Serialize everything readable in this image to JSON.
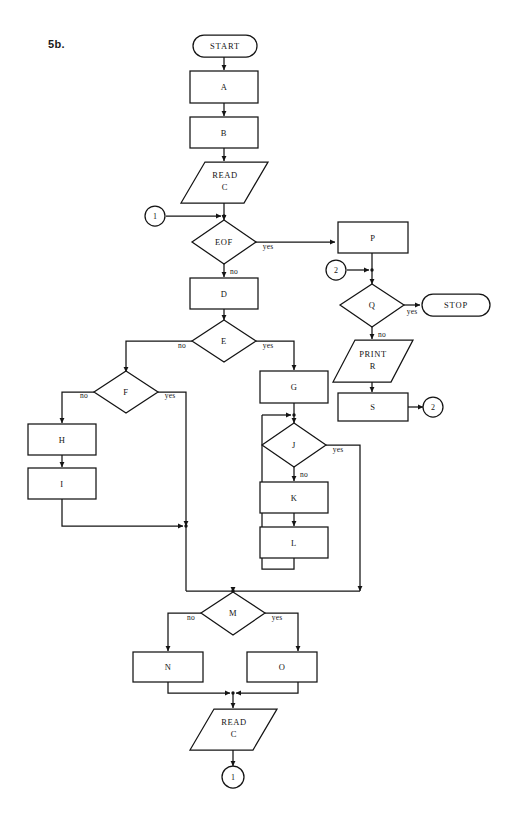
{
  "figure": {
    "label": "5b.",
    "ink_color": "#141414",
    "paper_color": "#ffffff"
  },
  "nodes": {
    "start": {
      "text": "START",
      "shape": "terminator"
    },
    "a": {
      "text": "A",
      "shape": "process"
    },
    "b": {
      "text": "B",
      "shape": "process"
    },
    "read_c_top_line1": {
      "text": "READ",
      "shape": "io"
    },
    "read_c_top_line2": {
      "text": "C",
      "shape": "io"
    },
    "conn_1_top": {
      "text": "1",
      "shape": "connector"
    },
    "eof": {
      "text": "EOF",
      "shape": "decision"
    },
    "d": {
      "text": "D",
      "shape": "process"
    },
    "e": {
      "text": "E",
      "shape": "decision"
    },
    "f": {
      "text": "F",
      "shape": "decision"
    },
    "h": {
      "text": "H",
      "shape": "process"
    },
    "i": {
      "text": "I",
      "shape": "process"
    },
    "g": {
      "text": "G",
      "shape": "process"
    },
    "j": {
      "text": "J",
      "shape": "decision"
    },
    "k": {
      "text": "K",
      "shape": "process"
    },
    "l": {
      "text": "L",
      "shape": "process"
    },
    "p": {
      "text": "P",
      "shape": "process"
    },
    "conn_2_left": {
      "text": "2",
      "shape": "connector"
    },
    "q": {
      "text": "Q",
      "shape": "decision"
    },
    "stop": {
      "text": "STOP",
      "shape": "terminator"
    },
    "print_r_line1": {
      "text": "PRINT",
      "shape": "io"
    },
    "print_r_line2": {
      "text": "R",
      "shape": "io"
    },
    "s": {
      "text": "S",
      "shape": "process"
    },
    "conn_2_right": {
      "text": "2",
      "shape": "connector"
    },
    "m": {
      "text": "M",
      "shape": "decision"
    },
    "n": {
      "text": "N",
      "shape": "process"
    },
    "o": {
      "text": "O",
      "shape": "process"
    },
    "read_c_bottom_line1": {
      "text": "READ",
      "shape": "io"
    },
    "read_c_bottom_line2": {
      "text": "C",
      "shape": "io"
    },
    "conn_1_bottom": {
      "text": "1",
      "shape": "connector"
    }
  },
  "edge_labels": {
    "eof_yes": "yes",
    "eof_no": "no",
    "e_no": "no",
    "e_yes": "yes",
    "f_no": "no",
    "f_yes": "yes",
    "j_no": "no",
    "j_yes": "yes",
    "q_yes": "yes",
    "q_no": "no",
    "m_no": "no",
    "m_yes": "yes"
  },
  "flow": {
    "sequence": [
      "START -> A",
      "A -> B",
      "B -> READ C",
      "READ C -> EOF (join with connector 1)",
      "EOF yes -> P",
      "EOF no -> D",
      "D -> E",
      "E no -> F",
      "E yes -> G",
      "F no -> H",
      "H -> I",
      "F yes -> join",
      "I -> join",
      "G -> J",
      "J no -> K",
      "K -> L",
      "L -> back to J",
      "J yes -> join",
      "join -> M",
      "M no -> N",
      "M yes -> O",
      "N -> READ C (bottom)",
      "O -> READ C (bottom)",
      "READ C (bottom) -> connector 1",
      "P -> Q (join with connector 2)",
      "Q yes -> STOP",
      "Q no -> PRINT R",
      "PRINT R -> S",
      "S -> connector 2"
    ]
  }
}
